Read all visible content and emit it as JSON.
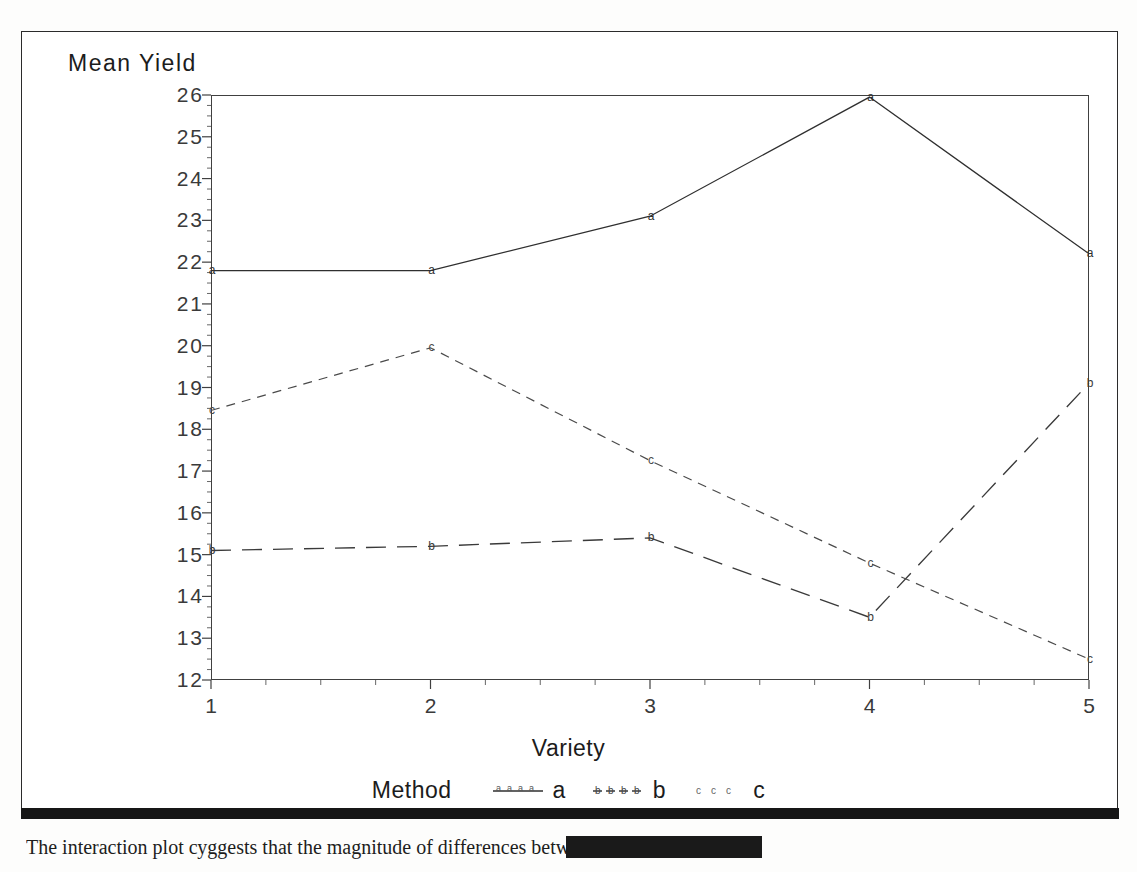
{
  "figure": {
    "y_axis_title": "Mean Yield",
    "x_axis_title": "Variety",
    "legend_title": "Method"
  },
  "caption": {
    "text": "The interaction plot суggests that the magnitude of differences between"
  },
  "colors": {
    "ink": "#1c1c1c",
    "axis": "#404040",
    "series_a": "#2f2f2f",
    "series_b": "#3a3a3a",
    "series_c": "#4a4a4a"
  },
  "chart_data": {
    "type": "line",
    "title": "",
    "subtitle": "",
    "xlabel": "Variety",
    "ylabel": "Mean Yield",
    "legend_title": "Method",
    "legend_position": "bottom",
    "grid": false,
    "x": [
      1,
      2,
      3,
      4,
      5
    ],
    "categories": [
      "1",
      "2",
      "3",
      "4",
      "5"
    ],
    "xlim": [
      1,
      5
    ],
    "ylim": [
      12,
      26
    ],
    "ytick_labels": [
      "26",
      "25",
      "24",
      "23",
      "22",
      "21",
      "20",
      "19",
      "18",
      "17",
      "16",
      "15",
      "14",
      "13",
      "12"
    ],
    "yticks": [
      26,
      25,
      24,
      23,
      22,
      21,
      20,
      19,
      18,
      17,
      16,
      15,
      14,
      13,
      12
    ],
    "xtick_labels": [
      "1",
      "2",
      "3",
      "4",
      "5"
    ],
    "minor_ticks": true,
    "series": [
      {
        "name": "a",
        "label": "a",
        "linestyle": "solid",
        "marker": "a",
        "values": [
          21.8,
          21.8,
          23.1,
          25.95,
          22.2
        ]
      },
      {
        "name": "b",
        "label": "b",
        "linestyle": "long-dash",
        "marker": "b",
        "values": [
          15.1,
          15.2,
          15.4,
          13.5,
          19.1
        ]
      },
      {
        "name": "c",
        "label": "c",
        "linestyle": "short-dash",
        "marker": "c",
        "values": [
          18.45,
          19.95,
          17.25,
          14.8,
          12.5
        ]
      }
    ]
  }
}
